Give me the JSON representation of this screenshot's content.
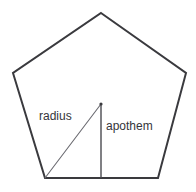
{
  "figure": {
    "background_color": "#ffffff",
    "width": 196,
    "height": 192
  },
  "labels": {
    "radius": "radius",
    "apothem": "apothem"
  },
  "shape": {
    "name": "regular-pentagon",
    "stroke_color": "#3a3a3e",
    "stroke_width": 2,
    "fill": "#ffffff",
    "vertices": [
      {
        "name": "apex",
        "x": 101,
        "y": 13
      },
      {
        "name": "upper-right",
        "x": 186,
        "y": 73
      },
      {
        "name": "lower-right",
        "x": 158,
        "y": 178
      },
      {
        "name": "lower-left",
        "x": 45,
        "y": 178
      },
      {
        "name": "upper-left",
        "x": 13,
        "y": 73
      }
    ],
    "points_attr": "101,13 186,73 158,178 45,178 13,73"
  },
  "segments": {
    "center": {
      "x": 101,
      "y": 104
    },
    "radius_line": {
      "name": "radius-segment",
      "x1": 101,
      "y1": 104,
      "x2": 45,
      "y2": 178,
      "stroke_color": "#6a6a70",
      "stroke_width": 1.1
    },
    "apothem_line": {
      "name": "apothem-segment",
      "x1": 101,
      "y1": 104,
      "x2": 101,
      "y2": 178,
      "stroke_color": "#4a4a50",
      "stroke_width": 1.4
    },
    "center_dot": {
      "name": "center-vertex-dot",
      "cx": 101,
      "cy": 104,
      "r": 1.6,
      "fill": "#3a3a3e"
    }
  }
}
